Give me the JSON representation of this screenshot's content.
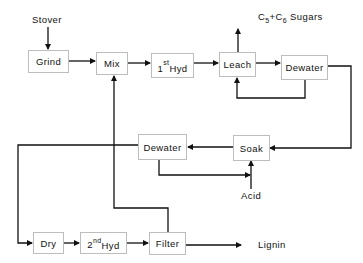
{
  "diagram": {
    "inputs": {
      "stover": "Stover",
      "acid": "Acid"
    },
    "outputs": {
      "sugars": {
        "c": "C",
        "s5": "5",
        "plus": "+C",
        "s6": "6",
        "rest": " Sugars"
      },
      "lignin": "Lignin"
    },
    "nodes": {
      "grind": "Grind",
      "mix": "Mix",
      "hyd1": {
        "num": "1",
        "sup": "st",
        "text": "Hyd"
      },
      "leach": "Leach",
      "dewater1": "Dewater",
      "soak": "Soak",
      "dewater2": "Dewater",
      "dry": "Dry",
      "hyd2": {
        "num": "2",
        "sup": "nd",
        "text": "Hyd"
      },
      "filter": "Filter"
    },
    "colors": {
      "line": "#111111",
      "box_border": "#bdbdbd"
    }
  }
}
